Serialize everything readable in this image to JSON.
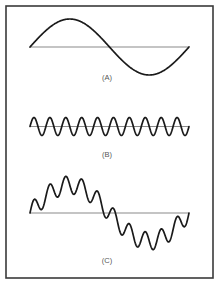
{
  "figure": {
    "frame": {
      "x": 6,
      "y": 6,
      "width": 207,
      "height": 272,
      "color": "#3a3a3a"
    },
    "panels": [
      {
        "id": "A",
        "label": "(A)",
        "description": "Fundamental sine wave, one full cycle",
        "baseline_y": 47,
        "x_start": 30,
        "x_end": 189,
        "components": [
          {
            "amplitude": 28,
            "cycles": 1,
            "phase": 0
          }
        ],
        "label_pos": {
          "x": 107,
          "y": 80
        }
      },
      {
        "id": "B",
        "label": "(B)",
        "description": "Higher-frequency sine wave, ten cycles",
        "baseline_y": 126.5,
        "x_start": 30,
        "x_end": 189,
        "components": [
          {
            "amplitude": 9,
            "cycles": 10,
            "phase": 0
          }
        ],
        "label_pos": {
          "x": 107,
          "y": 157
        }
      },
      {
        "id": "C",
        "label": "(C)",
        "description": "Sum of waveforms A and B",
        "baseline_y": 213,
        "x_start": 30,
        "x_end": 189,
        "components": [
          {
            "amplitude": 28,
            "cycles": 1,
            "phase": 0
          },
          {
            "amplitude": 9,
            "cycles": 10,
            "phase": 0
          }
        ],
        "label_pos": {
          "x": 107,
          "y": 263
        }
      }
    ],
    "colors": {
      "wave": "#1a1a1a",
      "baseline": "#8a8a8a",
      "label": "#555555",
      "background": "#ffffff"
    }
  }
}
